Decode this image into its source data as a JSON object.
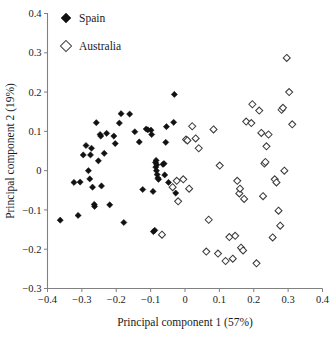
{
  "chart_data": {
    "type": "scatter",
    "title": "",
    "xlabel": "Principal component 1 (57%)",
    "ylabel": "Principal component 2 (19%)",
    "xlim": [
      -0.4,
      0.4
    ],
    "ylim": [
      -0.3,
      0.4
    ],
    "xticks": [
      -0.4,
      -0.3,
      -0.2,
      -0.1,
      0,
      0.1,
      0.2,
      0.3,
      0.4
    ],
    "xticklabels": [
      "−0.4",
      "−0.3",
      "−0.2",
      "−0.1",
      "0",
      "0.1",
      "0.2",
      "0.3",
      "0.4"
    ],
    "yticks": [
      -0.3,
      -0.2,
      -0.1,
      0,
      0.1,
      0.2,
      0.3,
      0.4
    ],
    "yticklabels": [
      "−0.3",
      "−0.2",
      "−0.1",
      "0",
      "0.1",
      "0.2",
      "0.3",
      "0.4"
    ],
    "grid": false,
    "legend_position": "top-left",
    "series": [
      {
        "name": "Spain",
        "marker": "filled-diamond",
        "color": "#111111",
        "points": [
          [
            -0.363,
            -0.126
          ],
          [
            -0.323,
            -0.03
          ],
          [
            -0.311,
            -0.114
          ],
          [
            -0.305,
            -0.029
          ],
          [
            -0.296,
            0.04
          ],
          [
            -0.288,
            0.064
          ],
          [
            -0.281,
            0.0
          ],
          [
            -0.277,
            -0.021
          ],
          [
            -0.275,
            0.04
          ],
          [
            -0.272,
            0.057
          ],
          [
            -0.269,
            -0.042
          ],
          [
            -0.264,
            -0.086
          ],
          [
            -0.263,
            -0.091
          ],
          [
            -0.258,
            0.122
          ],
          [
            -0.252,
            0.025
          ],
          [
            -0.247,
            0.092
          ],
          [
            -0.245,
            0.088
          ],
          [
            -0.243,
            -0.039
          ],
          [
            -0.235,
            0.044
          ],
          [
            -0.228,
            0.095
          ],
          [
            -0.219,
            -0.087
          ],
          [
            -0.207,
            0.088
          ],
          [
            -0.203,
            0.069
          ],
          [
            -0.191,
            0.121
          ],
          [
            -0.186,
            0.145
          ],
          [
            -0.178,
            -0.132
          ],
          [
            -0.161,
            0.144
          ],
          [
            -0.146,
            0.099
          ],
          [
            -0.133,
            0.073
          ],
          [
            -0.123,
            -0.048
          ],
          [
            -0.113,
            0.106
          ],
          [
            -0.108,
            0.104
          ],
          [
            -0.099,
            0.103
          ],
          [
            -0.097,
            0.092
          ],
          [
            -0.093,
            -0.053
          ],
          [
            -0.092,
            -0.155
          ],
          [
            -0.088,
            -0.152
          ],
          [
            -0.086,
            0.021
          ],
          [
            -0.085,
            0.009
          ],
          [
            -0.084,
            0.026
          ],
          [
            -0.083,
            0.0
          ],
          [
            -0.082,
            0.015
          ],
          [
            -0.081,
            -0.01
          ],
          [
            -0.079,
            -0.019
          ],
          [
            -0.077,
            -0.022
          ],
          [
            -0.064,
            0.016
          ],
          [
            -0.061,
            0.018
          ],
          [
            -0.059,
            -0.011
          ],
          [
            -0.056,
            0.072
          ],
          [
            -0.054,
            0.112
          ],
          [
            -0.048,
            -0.03
          ],
          [
            -0.033,
            0.123
          ],
          [
            -0.031,
            0.194
          ],
          [
            -0.027,
            -0.057
          ]
        ]
      },
      {
        "name": "Australia",
        "marker": "open-diamond",
        "color": "#3b3b3b",
        "points": [
          [
            -0.067,
            -0.163
          ],
          [
            -0.036,
            -0.042
          ],
          [
            -0.024,
            -0.026
          ],
          [
            -0.02,
            -0.078
          ],
          [
            -0.005,
            -0.022
          ],
          [
            0.003,
            0.079
          ],
          [
            0.007,
            0.077
          ],
          [
            0.012,
            -0.046
          ],
          [
            0.021,
            0.113
          ],
          [
            0.031,
            0.082
          ],
          [
            0.04,
            0.057
          ],
          [
            0.062,
            -0.206
          ],
          [
            0.069,
            -0.125
          ],
          [
            0.083,
            0.105
          ],
          [
            0.096,
            -0.211
          ],
          [
            0.101,
            0.013
          ],
          [
            0.118,
            -0.23
          ],
          [
            0.129,
            -0.169
          ],
          [
            0.139,
            -0.224
          ],
          [
            0.146,
            -0.166
          ],
          [
            0.152,
            -0.026
          ],
          [
            0.158,
            -0.058
          ],
          [
            0.16,
            -0.046
          ],
          [
            0.163,
            -0.196
          ],
          [
            0.169,
            -0.203
          ],
          [
            0.172,
            -0.072
          ],
          [
            0.178,
            0.125
          ],
          [
            0.193,
            0.121
          ],
          [
            0.196,
            0.169
          ],
          [
            0.208,
            -0.236
          ],
          [
            0.216,
            0.153
          ],
          [
            0.222,
            0.096
          ],
          [
            0.227,
            -0.065
          ],
          [
            0.231,
            0.018
          ],
          [
            0.234,
            0.022
          ],
          [
            0.237,
            0.062
          ],
          [
            0.243,
            0.092
          ],
          [
            0.255,
            -0.17
          ],
          [
            0.261,
            -0.022
          ],
          [
            0.266,
            -0.03
          ],
          [
            0.272,
            -0.102
          ],
          [
            0.277,
            -0.14
          ],
          [
            0.281,
            0.155
          ],
          [
            0.285,
            0.16
          ],
          [
            0.289,
            0.0
          ],
          [
            0.296,
            0.287
          ],
          [
            0.303,
            0.2
          ],
          [
            0.312,
            0.118
          ]
        ]
      }
    ]
  },
  "legend": {
    "items": [
      {
        "label": "Spain",
        "marker": "filled-diamond"
      },
      {
        "label": "Australia",
        "marker": "open-diamond"
      }
    ]
  }
}
